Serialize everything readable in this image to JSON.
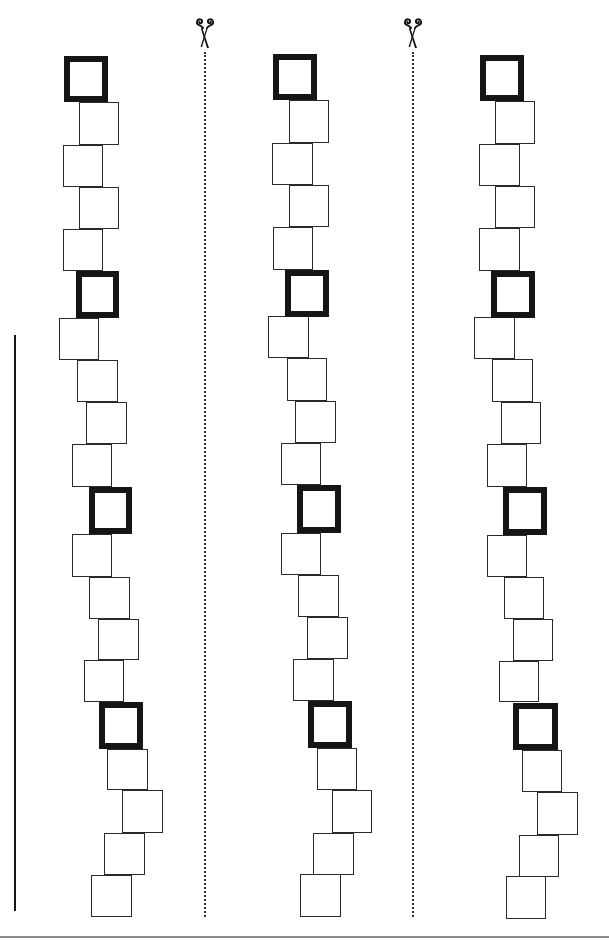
{
  "worksheet": {
    "title": "Square tower tracing and cutting worksheet",
    "colors": {
      "ink": "#151515",
      "thin_stroke": "#2a2a2a",
      "dotted_line": "#333333",
      "bottom_rule": "#8a8a8a",
      "paper": "#ffffff"
    },
    "margin_line": {
      "x": 15,
      "y1": 335,
      "y2": 911
    },
    "bottom_rule": {
      "y": 937
    },
    "cut_lines": [
      {
        "icon": "scissors-icon",
        "x": 205,
        "icon_y": 16,
        "y1": 52,
        "y2": 917
      },
      {
        "icon": "scissors-icon",
        "x": 413,
        "icon_y": 16,
        "y1": 52,
        "y2": 917
      }
    ],
    "columns": [
      {
        "name": "column-1",
        "squares": [
          {
            "x": 64,
            "y": 56,
            "w": 44,
            "h": 46,
            "thick": true
          },
          {
            "x": 79,
            "y": 102,
            "w": 40,
            "h": 43,
            "thick": false
          },
          {
            "x": 63,
            "y": 145,
            "w": 40,
            "h": 42,
            "thick": false
          },
          {
            "x": 79,
            "y": 187,
            "w": 40,
            "h": 42,
            "thick": false
          },
          {
            "x": 63,
            "y": 229,
            "w": 40,
            "h": 42,
            "thick": false
          },
          {
            "x": 76,
            "y": 271,
            "w": 43,
            "h": 47,
            "thick": true
          },
          {
            "x": 59,
            "y": 318,
            "w": 40,
            "h": 42,
            "thick": false
          },
          {
            "x": 77,
            "y": 360,
            "w": 41,
            "h": 42,
            "thick": false
          },
          {
            "x": 86,
            "y": 402,
            "w": 41,
            "h": 42,
            "thick": false
          },
          {
            "x": 72,
            "y": 444,
            "w": 40,
            "h": 43,
            "thick": false
          },
          {
            "x": 89,
            "y": 487,
            "w": 43,
            "h": 47,
            "thick": true
          },
          {
            "x": 72,
            "y": 534,
            "w": 40,
            "h": 43,
            "thick": false
          },
          {
            "x": 89,
            "y": 577,
            "w": 41,
            "h": 42,
            "thick": false
          },
          {
            "x": 98,
            "y": 619,
            "w": 41,
            "h": 41,
            "thick": false
          },
          {
            "x": 84,
            "y": 660,
            "w": 40,
            "h": 42,
            "thick": false
          },
          {
            "x": 99,
            "y": 702,
            "w": 44,
            "h": 47,
            "thick": true
          },
          {
            "x": 107,
            "y": 749,
            "w": 41,
            "h": 41,
            "thick": false
          },
          {
            "x": 122,
            "y": 790,
            "w": 41,
            "h": 43,
            "thick": false
          },
          {
            "x": 104,
            "y": 833,
            "w": 41,
            "h": 42,
            "thick": false
          },
          {
            "x": 91,
            "y": 875,
            "w": 41,
            "h": 42,
            "thick": false
          }
        ]
      },
      {
        "name": "column-2",
        "squares": [
          {
            "x": 273,
            "y": 54,
            "w": 44,
            "h": 46,
            "thick": true
          },
          {
            "x": 289,
            "y": 100,
            "w": 40,
            "h": 43,
            "thick": false
          },
          {
            "x": 272,
            "y": 143,
            "w": 41,
            "h": 42,
            "thick": false
          },
          {
            "x": 289,
            "y": 185,
            "w": 40,
            "h": 42,
            "thick": false
          },
          {
            "x": 273,
            "y": 227,
            "w": 40,
            "h": 43,
            "thick": false
          },
          {
            "x": 285,
            "y": 270,
            "w": 44,
            "h": 47,
            "thick": true
          },
          {
            "x": 268,
            "y": 316,
            "w": 41,
            "h": 42,
            "thick": false
          },
          {
            "x": 287,
            "y": 358,
            "w": 40,
            "h": 43,
            "thick": false
          },
          {
            "x": 295,
            "y": 401,
            "w": 41,
            "h": 42,
            "thick": false
          },
          {
            "x": 281,
            "y": 443,
            "w": 40,
            "h": 42,
            "thick": false
          },
          {
            "x": 297,
            "y": 485,
            "w": 44,
            "h": 48,
            "thick": true
          },
          {
            "x": 281,
            "y": 533,
            "w": 40,
            "h": 42,
            "thick": false
          },
          {
            "x": 298,
            "y": 575,
            "w": 41,
            "h": 42,
            "thick": false
          },
          {
            "x": 307,
            "y": 617,
            "w": 41,
            "h": 42,
            "thick": false
          },
          {
            "x": 293,
            "y": 659,
            "w": 41,
            "h": 42,
            "thick": false
          },
          {
            "x": 308,
            "y": 701,
            "w": 44,
            "h": 47,
            "thick": true
          },
          {
            "x": 317,
            "y": 748,
            "w": 40,
            "h": 42,
            "thick": false
          },
          {
            "x": 332,
            "y": 790,
            "w": 40,
            "h": 43,
            "thick": false
          },
          {
            "x": 313,
            "y": 833,
            "w": 41,
            "h": 42,
            "thick": false
          },
          {
            "x": 300,
            "y": 874,
            "w": 41,
            "h": 43,
            "thick": false
          }
        ]
      },
      {
        "name": "column-3",
        "squares": [
          {
            "x": 480,
            "y": 55,
            "w": 44,
            "h": 46,
            "thick": true
          },
          {
            "x": 495,
            "y": 101,
            "w": 40,
            "h": 43,
            "thick": false
          },
          {
            "x": 479,
            "y": 144,
            "w": 41,
            "h": 42,
            "thick": false
          },
          {
            "x": 495,
            "y": 186,
            "w": 40,
            "h": 42,
            "thick": false
          },
          {
            "x": 479,
            "y": 228,
            "w": 41,
            "h": 43,
            "thick": false
          },
          {
            "x": 491,
            "y": 271,
            "w": 44,
            "h": 47,
            "thick": true
          },
          {
            "x": 474,
            "y": 317,
            "w": 41,
            "h": 42,
            "thick": false
          },
          {
            "x": 492,
            "y": 359,
            "w": 41,
            "h": 43,
            "thick": false
          },
          {
            "x": 501,
            "y": 402,
            "w": 40,
            "h": 42,
            "thick": false
          },
          {
            "x": 487,
            "y": 444,
            "w": 40,
            "h": 43,
            "thick": false
          },
          {
            "x": 503,
            "y": 487,
            "w": 44,
            "h": 48,
            "thick": true
          },
          {
            "x": 487,
            "y": 535,
            "w": 40,
            "h": 42,
            "thick": false
          },
          {
            "x": 504,
            "y": 577,
            "w": 40,
            "h": 42,
            "thick": false
          },
          {
            "x": 513,
            "y": 619,
            "w": 40,
            "h": 42,
            "thick": false
          },
          {
            "x": 499,
            "y": 661,
            "w": 40,
            "h": 41,
            "thick": false
          },
          {
            "x": 513,
            "y": 703,
            "w": 45,
            "h": 47,
            "thick": true
          },
          {
            "x": 522,
            "y": 750,
            "w": 40,
            "h": 42,
            "thick": false
          },
          {
            "x": 537,
            "y": 792,
            "w": 41,
            "h": 43,
            "thick": false
          },
          {
            "x": 519,
            "y": 835,
            "w": 40,
            "h": 42,
            "thick": false
          },
          {
            "x": 506,
            "y": 876,
            "w": 40,
            "h": 43,
            "thick": false
          }
        ]
      }
    ]
  }
}
